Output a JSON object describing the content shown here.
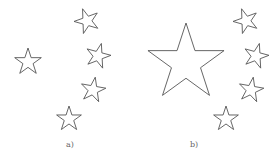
{
  "panels": [
    {
      "id": "a",
      "label": "a)",
      "stars": [
        {
          "cx": 28,
          "cy": 62,
          "r": 14,
          "rotation": 0
        },
        {
          "cx": 87,
          "cy": 21,
          "r": 13,
          "rotation": -20
        },
        {
          "cx": 98,
          "cy": 56,
          "r": 13,
          "rotation": 15
        },
        {
          "cx": 93,
          "cy": 90,
          "r": 13,
          "rotation": 10
        },
        {
          "cx": 69,
          "cy": 119,
          "r": 13,
          "rotation": 0
        }
      ]
    },
    {
      "id": "b",
      "label": "b)",
      "stars": [
        {
          "cx": 186,
          "cy": 63,
          "r": 40,
          "rotation": 0
        },
        {
          "cx": 246,
          "cy": 21,
          "r": 13,
          "rotation": -20
        },
        {
          "cx": 256,
          "cy": 56,
          "r": 13,
          "rotation": 15
        },
        {
          "cx": 251,
          "cy": 90,
          "r": 13,
          "rotation": 10
        },
        {
          "cx": 226,
          "cy": 119,
          "r": 13,
          "rotation": 0
        }
      ]
    }
  ],
  "colors": {
    "stroke": "#555555",
    "fill": "#ffffff",
    "label": "#666666"
  }
}
